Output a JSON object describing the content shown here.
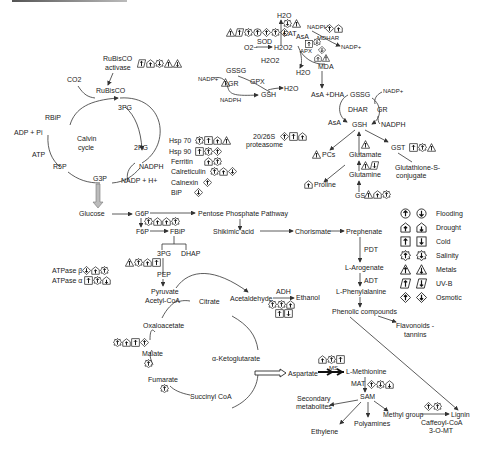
{
  "figure": {
    "nodes": {
      "calvin": {
        "rubisco_activase": [
          "RuBisCO",
          "activase"
        ],
        "co2": "CO2",
        "rubisco": "RuBisCO",
        "pg3": "3PG",
        "rbip": "RBiP",
        "adp": "ADP + Pi",
        "cycle": [
          "Calvin",
          "cycle"
        ],
        "pg2": "2PG",
        "atp": "ATP",
        "r5p": "R5P",
        "nadph": "NADPH",
        "g3p": "G3P",
        "nadp": "NADP + H+"
      },
      "chaperones": [
        "Hsp 70",
        "Hsp 90",
        "Ferritin",
        "Calreticulin",
        "Calnexin",
        "BiP"
      ],
      "proteasome": [
        "20/26S",
        "proteasome"
      ],
      "ros": {
        "h2o_top": "H2O",
        "cat": "CAT",
        "o2": "O2−",
        "sod": "SOD",
        "h2o2": "H2O2",
        "apx": "APX",
        "h2o_apx": "H2O",
        "asa": "AsA",
        "nadph_top": "NADPH",
        "mdhar": "MDHAR",
        "nadp_top": "NADP+",
        "mda": "MDA",
        "gssg_l": "GSSG",
        "h2o2_b": "H2O2",
        "nadp_l": "NADP+",
        "gpx": "GPX",
        "gr_l": "GR",
        "gsh_l": "GSH",
        "h2o_l": "H2O",
        "nadph_l": "NADPH"
      },
      "glutathione": {
        "asa_dha": "AsA +DHA",
        "gssg": "GSSG",
        "nadp": "NADP+",
        "dhar": "DHAR",
        "gr": "GR",
        "asa": "AsA",
        "gsh": "GSH",
        "nadph": "NADPH",
        "pcs": "PCs",
        "glutamate": "Glutamate",
        "gst": "GST",
        "conjugate": [
          "Glutathione-S-",
          "conjugate"
        ],
        "proline": "Proline",
        "glutamine": "Glutamine",
        "gs": "GS"
      },
      "glycolysis": {
        "glucose": "Glucose",
        "g6p": "G6P",
        "ppp": "Pentose Phosphate Pathway",
        "f6p": "F6P",
        "fbip": "FBiP",
        "shikimic": "Shikimic acid",
        "chorismate": "Chorismate",
        "prephenate": "Prephenate",
        "pg3": "3PG",
        "dhap": "DHAP",
        "atpase_b": "ATPase β",
        "atpase_a": "ATPase α",
        "pep": "PEP",
        "pyruvate": "Pyruvate",
        "acetylcoa": "Acetyl-CoA",
        "citrate": "Citrate",
        "acetaldehyde": "Acetaldehyde",
        "adh": "ADH",
        "ethanol": "Ethanol"
      },
      "tca": {
        "oxaloacetate": "Oxaloacetate",
        "akg": "α-Ketoglutarate",
        "malate": "Malate",
        "fumarate": "Fumarate",
        "succinyl": "Succinyl CoA"
      },
      "phenyl": {
        "pdt": "PDT",
        "arogenate": "L-Arogenate",
        "adt": "ADT",
        "phenylalanine": "L-Phenylalanine",
        "phenolic": "Phenolic compounds",
        "flavonoids": [
          "Flavonoids -",
          "tannins"
        ]
      },
      "methionine": {
        "aspartate": "Aspartate",
        "ms": "MS",
        "methionine": "L-Methionine",
        "mat": "MAT",
        "sam": "SAM",
        "secondary": [
          "Secondary",
          "metabolites"
        ],
        "methyl": "Methyl group",
        "lignin": "Lignin",
        "ethylene": "Ethylene",
        "polyamines": "Polyamines",
        "ccoaomt": [
          "Caffeoyl-CoA",
          "3-O-MT"
        ]
      }
    },
    "legend": [
      {
        "label": "Flooding",
        "shape": "circle"
      },
      {
        "label": "Drought",
        "shape": "house"
      },
      {
        "label": "Cold",
        "shape": "square"
      },
      {
        "label": "Salinity",
        "shape": "gear"
      },
      {
        "label": "Metals",
        "shape": "triangle"
      },
      {
        "label": "UV-B",
        "shape": "parallelogram"
      },
      {
        "label": "Osmotic",
        "shape": "diamond"
      }
    ],
    "legend_note": "left column = up-regulated, right column = down-regulated"
  }
}
